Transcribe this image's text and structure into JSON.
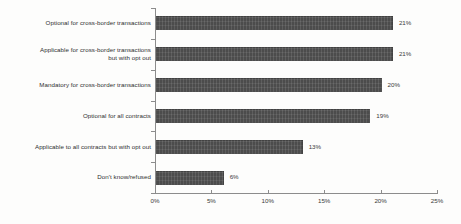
{
  "chart_data": {
    "type": "bar",
    "orientation": "horizontal",
    "title": "",
    "xlabel": "",
    "ylabel": "",
    "xlim": [
      0,
      25
    ],
    "xtick_labels": [
      "0%",
      "5%",
      "10%",
      "15%",
      "20%",
      "25%"
    ],
    "xtick_values": [
      0,
      5,
      10,
      15,
      20,
      25
    ],
    "grid": false,
    "legend": "none",
    "bar_color": "#4c4c4c",
    "categories": [
      "Optional for cross-border transactions",
      "Applicable for cross-border transactions\nbut with opt out",
      "Mandatory for cross-border transactions",
      "Optional for all contracts",
      "Applicable to all contracts but with opt out",
      "Don't know/refused"
    ],
    "values": [
      21,
      21,
      20,
      19,
      13,
      6
    ],
    "value_labels": [
      "21%",
      "21%",
      "20%",
      "19%",
      "13%",
      "6%"
    ]
  }
}
